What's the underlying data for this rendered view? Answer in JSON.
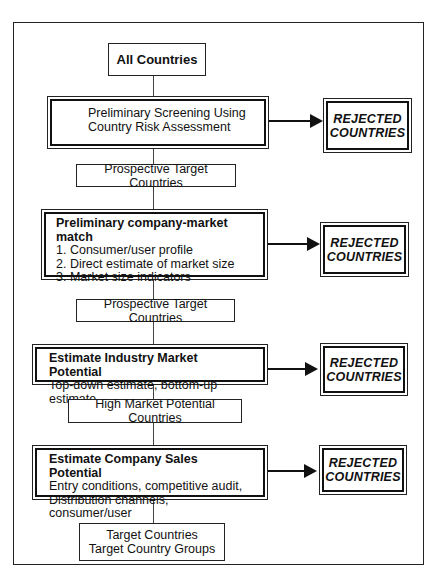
{
  "diagram": {
    "start": {
      "label": "All Countries"
    },
    "steps": [
      {
        "title": "Preliminary Screening Using",
        "lines": [
          "Country Risk Assessment"
        ],
        "output": "Prospective Target Countries",
        "rejected": [
          "REJECTED",
          "COUNTRIES"
        ]
      },
      {
        "title": "Preliminary company-market match",
        "lines": [
          "1. Consumer/user profile",
          "2. Direct estimate of market size",
          "3. Market size indicators"
        ],
        "output": "Prospective Target Countries",
        "rejected": [
          "REJECTED",
          "COUNTRIES"
        ]
      },
      {
        "title": "Estimate Industry Market Potential",
        "lines": [
          "Top-down estimate, bottom-up estimate"
        ],
        "output": "High Market Potential Countries",
        "rejected": [
          "REJECTED",
          "COUNTRIES"
        ]
      },
      {
        "title": "Estimate Company Sales Potential",
        "lines": [
          "Entry conditions, competitive audit,",
          "Distribution channels, consumer/user"
        ],
        "output_lines": [
          "Target Countries",
          "Target Country Groups"
        ],
        "rejected": [
          "REJECTED",
          "COUNTRIES"
        ]
      }
    ]
  }
}
